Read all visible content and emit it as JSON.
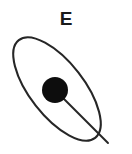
{
  "figure": {
    "title_label": "E",
    "background_color": "#ffffff",
    "stroke_color": "#262626",
    "body_fill_color": "#0d0d0d",
    "orbit": {
      "name": "orbit-ellipse",
      "center_x": 57,
      "center_y": 89,
      "semi_major": 62,
      "semi_minor": 27,
      "rotation_deg": 52,
      "stroke_width": 2.1
    },
    "central_body": {
      "name": "earth",
      "label": "E",
      "center_x": 55,
      "center_y": 90,
      "radius": 13
    },
    "radius_line": {
      "name": "radius-line",
      "x1": 55,
      "y1": 90,
      "x2": 108,
      "y2": 143,
      "stroke_width": 1.9
    }
  }
}
